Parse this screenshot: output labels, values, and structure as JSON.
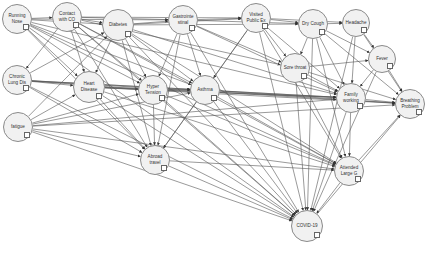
{
  "diagram": {
    "type": "bayesian-network",
    "nodes": [
      {
        "id": "running_nose",
        "label": "Running\nNose",
        "x": 17,
        "y": 19,
        "r": 15
      },
      {
        "id": "contact_co",
        "label": "Contact\nwith CO",
        "x": 67,
        "y": 17,
        "r": 15
      },
      {
        "id": "diabetes",
        "label": "Diabetes",
        "x": 118,
        "y": 25,
        "r": 16
      },
      {
        "id": "gastro",
        "label": "Gastrointe\nstinal",
        "x": 183,
        "y": 20,
        "r": 15
      },
      {
        "id": "visited_public",
        "label": "Visited\nPublic Ex",
        "x": 256,
        "y": 18,
        "r": 15
      },
      {
        "id": "dry_cough",
        "label": "Dry Cough",
        "x": 313,
        "y": 24,
        "r": 15
      },
      {
        "id": "headache",
        "label": "Headache",
        "x": 356,
        "y": 23,
        "r": 14
      },
      {
        "id": "fever",
        "label": "Fever",
        "x": 382,
        "y": 59,
        "r": 14
      },
      {
        "id": "sore_throat",
        "label": "Sore throat",
        "x": 295,
        "y": 68,
        "r": 15
      },
      {
        "id": "chronic_lung",
        "label": "Chronic\nLung Dis",
        "x": 17,
        "y": 80,
        "r": 15
      },
      {
        "id": "heart_disease",
        "label": "Heart\nDisease",
        "x": 89,
        "y": 87,
        "r": 16
      },
      {
        "id": "hyper_tension",
        "label": "Hyper\nTension",
        "x": 153,
        "y": 90,
        "r": 15
      },
      {
        "id": "asthma",
        "label": "Asthma",
        "x": 205,
        "y": 90,
        "r": 15
      },
      {
        "id": "family_working",
        "label": "Family\nworking",
        "x": 351,
        "y": 98,
        "r": 15
      },
      {
        "id": "breathing",
        "label": "Breathing\nProblem",
        "x": 410,
        "y": 104,
        "r": 15
      },
      {
        "id": "fatigue",
        "label": "fatigue",
        "x": 18,
        "y": 127,
        "r": 15
      },
      {
        "id": "abroad",
        "label": "Abroad\ntravel",
        "x": 155,
        "y": 160,
        "r": 15
      },
      {
        "id": "attended",
        "label": "Attended\nLarge G",
        "x": 349,
        "y": 171,
        "r": 15
      },
      {
        "id": "covid",
        "label": "COVID-19",
        "x": 307,
        "y": 226,
        "r": 16
      }
    ],
    "edges": [
      [
        "running_nose",
        "contact_co"
      ],
      [
        "running_nose",
        "diabetes"
      ],
      [
        "running_nose",
        "gastro"
      ],
      [
        "running_nose",
        "heart_disease"
      ],
      [
        "running_nose",
        "hyper_tension"
      ],
      [
        "running_nose",
        "asthma"
      ],
      [
        "running_nose",
        "abroad"
      ],
      [
        "running_nose",
        "covid"
      ],
      [
        "running_nose",
        "attended"
      ],
      [
        "running_nose",
        "family_working"
      ],
      [
        "contact_co",
        "diabetes"
      ],
      [
        "contact_co",
        "gastro"
      ],
      [
        "contact_co",
        "visited_public"
      ],
      [
        "contact_co",
        "heart_disease"
      ],
      [
        "contact_co",
        "hyper_tension"
      ],
      [
        "contact_co",
        "asthma"
      ],
      [
        "contact_co",
        "abroad"
      ],
      [
        "contact_co",
        "covid"
      ],
      [
        "contact_co",
        "attended"
      ],
      [
        "contact_co",
        "sore_throat"
      ],
      [
        "contact_co",
        "chronic_lung"
      ],
      [
        "diabetes",
        "gastro"
      ],
      [
        "diabetes",
        "visited_public"
      ],
      [
        "diabetes",
        "dry_cough"
      ],
      [
        "diabetes",
        "heart_disease"
      ],
      [
        "diabetes",
        "hyper_tension"
      ],
      [
        "diabetes",
        "asthma"
      ],
      [
        "diabetes",
        "abroad"
      ],
      [
        "diabetes",
        "covid"
      ],
      [
        "diabetes",
        "family_working"
      ],
      [
        "diabetes",
        "attended"
      ],
      [
        "gastro",
        "visited_public"
      ],
      [
        "gastro",
        "dry_cough"
      ],
      [
        "gastro",
        "hyper_tension"
      ],
      [
        "gastro",
        "asthma"
      ],
      [
        "gastro",
        "abroad"
      ],
      [
        "gastro",
        "covid"
      ],
      [
        "gastro",
        "sore_throat"
      ],
      [
        "gastro",
        "family_working"
      ],
      [
        "visited_public",
        "dry_cough"
      ],
      [
        "visited_public",
        "headache"
      ],
      [
        "visited_public",
        "asthma"
      ],
      [
        "visited_public",
        "covid"
      ],
      [
        "visited_public",
        "sore_throat"
      ],
      [
        "visited_public",
        "attended"
      ],
      [
        "visited_public",
        "family_working"
      ],
      [
        "visited_public",
        "abroad"
      ],
      [
        "dry_cough",
        "headache"
      ],
      [
        "dry_cough",
        "fever"
      ],
      [
        "dry_cough",
        "sore_throat"
      ],
      [
        "dry_cough",
        "family_working"
      ],
      [
        "dry_cough",
        "breathing"
      ],
      [
        "dry_cough",
        "covid"
      ],
      [
        "dry_cough",
        "attended"
      ],
      [
        "headache",
        "fever"
      ],
      [
        "headache",
        "breathing"
      ],
      [
        "headache",
        "family_working"
      ],
      [
        "headache",
        "covid"
      ],
      [
        "fever",
        "breathing"
      ],
      [
        "fever",
        "family_working"
      ],
      [
        "fever",
        "covid"
      ],
      [
        "sore_throat",
        "fever"
      ],
      [
        "sore_throat",
        "breathing"
      ],
      [
        "sore_throat",
        "family_working"
      ],
      [
        "sore_throat",
        "covid"
      ],
      [
        "sore_throat",
        "attended"
      ],
      [
        "chronic_lung",
        "diabetes"
      ],
      [
        "chronic_lung",
        "heart_disease"
      ],
      [
        "chronic_lung",
        "hyper_tension"
      ],
      [
        "chronic_lung",
        "asthma"
      ],
      [
        "chronic_lung",
        "abroad"
      ],
      [
        "chronic_lung",
        "covid"
      ],
      [
        "chronic_lung",
        "family_working"
      ],
      [
        "chronic_lung",
        "breathing"
      ],
      [
        "heart_disease",
        "hyper_tension"
      ],
      [
        "heart_disease",
        "asthma"
      ],
      [
        "heart_disease",
        "abroad"
      ],
      [
        "heart_disease",
        "covid"
      ],
      [
        "heart_disease",
        "family_working"
      ],
      [
        "heart_disease",
        "attended"
      ],
      [
        "heart_disease",
        "breathing"
      ],
      [
        "hyper_tension",
        "asthma"
      ],
      [
        "hyper_tension",
        "abroad"
      ],
      [
        "hyper_tension",
        "covid"
      ],
      [
        "hyper_tension",
        "family_working"
      ],
      [
        "hyper_tension",
        "attended"
      ],
      [
        "asthma",
        "family_working"
      ],
      [
        "asthma",
        "breathing"
      ],
      [
        "asthma",
        "covid"
      ],
      [
        "asthma",
        "attended"
      ],
      [
        "asthma",
        "abroad"
      ],
      [
        "family_working",
        "breathing"
      ],
      [
        "family_working",
        "attended"
      ],
      [
        "family_working",
        "covid"
      ],
      [
        "fatigue",
        "heart_disease"
      ],
      [
        "fatigue",
        "hyper_tension"
      ],
      [
        "fatigue",
        "asthma"
      ],
      [
        "fatigue",
        "family_working"
      ],
      [
        "fatigue",
        "breathing"
      ],
      [
        "fatigue",
        "abroad"
      ],
      [
        "fatigue",
        "covid"
      ],
      [
        "fatigue",
        "attended"
      ],
      [
        "fatigue",
        "diabetes"
      ],
      [
        "abroad",
        "covid"
      ],
      [
        "abroad",
        "attended"
      ],
      [
        "attended",
        "covid"
      ],
      [
        "attended",
        "breathing"
      ],
      [
        "covid",
        "breathing"
      ]
    ]
  }
}
